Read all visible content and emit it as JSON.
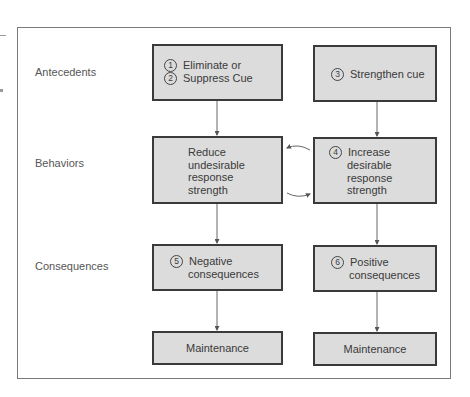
{
  "diagram": {
    "rows": [
      {
        "label": "Antecedents"
      },
      {
        "label": "Behaviors"
      },
      {
        "label": "Consequences"
      }
    ],
    "boxes": {
      "eliminate": {
        "lines": [
          {
            "num": "1",
            "text": "Eliminate or"
          },
          {
            "num": "2",
            "text": "Suppress Cue"
          }
        ]
      },
      "strengthen": {
        "num": "3",
        "text": "Strengthen cue"
      },
      "reduce": {
        "lines": [
          "Reduce",
          "undesirable",
          "response",
          "strength"
        ]
      },
      "increase": {
        "num": "4",
        "lines": [
          "Increase",
          "desirable",
          "response",
          "strength"
        ]
      },
      "negative": {
        "num": "5",
        "lines": [
          "Negative",
          "consequences"
        ]
      },
      "positive": {
        "num": "6",
        "lines": [
          "Positive",
          "consequences"
        ]
      },
      "maintenance_left": {
        "text": "Maintenance"
      },
      "maintenance_right": {
        "text": "Maintenance"
      }
    },
    "colors": {
      "box_fill": "#dcdcdc",
      "box_border": "#3a3a3a",
      "frame": "#7a7a7a",
      "arrow": "#555555"
    }
  }
}
